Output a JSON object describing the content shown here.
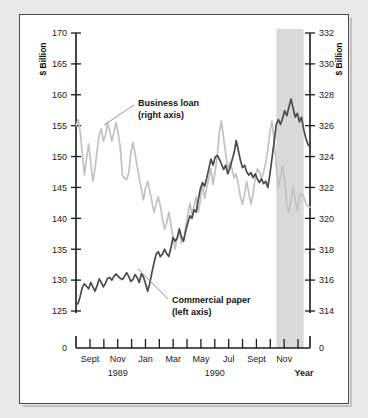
{
  "chart_data": {
    "type": "line",
    "title": "",
    "xlabel": "Year",
    "ylabel_left": "$ Billion",
    "ylabel_right": "$ Billion",
    "left_axis": {
      "label": "$ Billion",
      "ticks": [
        170,
        165,
        160,
        155,
        150,
        145,
        140,
        135,
        130,
        125
      ],
      "zero_tick": "0",
      "ylim": [
        125,
        170
      ],
      "broken_axis": true
    },
    "right_axis": {
      "label": "$ Billion",
      "ticks": [
        332,
        330,
        328,
        326,
        324,
        322,
        320,
        318,
        316,
        314
      ],
      "zero_tick": "0",
      "ylim": [
        314,
        332
      ],
      "broken_axis": true
    },
    "x_ticks": [
      "Sept",
      "",
      "Nov",
      "",
      "Jan",
      "",
      "Mar",
      "",
      "May",
      "",
      "Jul",
      "",
      "Sept",
      "",
      "Nov",
      ""
    ],
    "x_tick_labels": [
      "Sept",
      "Nov",
      "Jan",
      "Mar",
      "May",
      "Jul",
      "Sept",
      "Nov"
    ],
    "year_labels": [
      "1989",
      "1990"
    ],
    "grid": false,
    "legend_position": "inline-annotations",
    "shaded_band": {
      "label": "",
      "start_x": "Aug 1990",
      "end_x": "Oct 1990",
      "color": "#d9d9d9"
    },
    "annotations": [
      {
        "text_line1": "Business loan",
        "text_line2": "(right axis)",
        "series": "Business loan"
      },
      {
        "text_line1": "Commercial paper",
        "text_line2": "(left axis)",
        "series": "Commercial paper"
      }
    ],
    "series": [
      {
        "name": "Commercial paper",
        "axis": "left",
        "unit": "$ Billion",
        "color": "#4a4a4a",
        "values": [
          126.0,
          126.2,
          127.4,
          128.8,
          129.4,
          129.0,
          128.6,
          129.6,
          128.9,
          128.2,
          129.1,
          130.2,
          129.6,
          128.9,
          129.5,
          130.3,
          130.4,
          130.0,
          130.6,
          131.0,
          130.6,
          130.3,
          130.1,
          130.6,
          131.2,
          130.6,
          129.8,
          130.1,
          130.9,
          130.4,
          129.6,
          131.0,
          130.5,
          129.4,
          128.2,
          129.5,
          131.2,
          132.8,
          134.2,
          134.6,
          133.8,
          134.2,
          135.0,
          134.3,
          133.8,
          135.2,
          136.9,
          136.3,
          136.8,
          138.3,
          137.0,
          136.3,
          137.9,
          139.2,
          140.4,
          140.0,
          141.4,
          141.0,
          143.0,
          144.8,
          145.8,
          145.2,
          146.5,
          148.0,
          149.6,
          148.6,
          149.9,
          150.2,
          149.6,
          148.8,
          147.9,
          148.6,
          147.2,
          148.1,
          149.4,
          150.6,
          152.6,
          151.0,
          149.4,
          148.2,
          148.6,
          147.5,
          147.0,
          147.4,
          146.6,
          147.2,
          146.4,
          145.8,
          146.4,
          145.6,
          146.0,
          145.0,
          147.2,
          149.8,
          152.4,
          155.2,
          156.0,
          155.2,
          156.2,
          157.4,
          156.6,
          158.0,
          159.3,
          157.8,
          156.4,
          157.0,
          155.6,
          156.4,
          154.4,
          153.0,
          152.0,
          151.5
        ]
      },
      {
        "name": "Business loan",
        "axis": "right",
        "unit": "$ Billion",
        "color": "#c2c2c2",
        "values": [
          326.0,
          326.4,
          325.6,
          324.2,
          322.8,
          323.9,
          324.8,
          323.6,
          322.4,
          323.2,
          324.4,
          325.4,
          325.8,
          325.0,
          325.4,
          326.2,
          325.6,
          325.0,
          325.6,
          326.2,
          325.5,
          324.6,
          322.8,
          322.6,
          322.5,
          322.9,
          324.2,
          324.9,
          324.2,
          323.4,
          322.6,
          321.9,
          321.2,
          322.0,
          322.4,
          321.8,
          321.1,
          320.4,
          320.9,
          321.4,
          320.8,
          320.0,
          319.3,
          319.7,
          320.4,
          319.6,
          318.8,
          318.0,
          318.8,
          319.2,
          318.4,
          318.6,
          319.4,
          320.2,
          321.0,
          320.2,
          320.8,
          321.4,
          320.4,
          321.2,
          322.2,
          321.3,
          322.0,
          322.6,
          323.2,
          322.2,
          323.0,
          324.0,
          325.6,
          326.3,
          325.2,
          324.2,
          323.2,
          323.6,
          323.2,
          322.6,
          322.9,
          322.2,
          321.4,
          320.9,
          321.6,
          322.4,
          321.6,
          320.9,
          321.6,
          322.6,
          323.2,
          323.0,
          322.6,
          323.0,
          323.6,
          324.4,
          325.6,
          326.3,
          325.0,
          323.4,
          322.0,
          322.7,
          323.4,
          322.4,
          321.0,
          320.4,
          321.2,
          322.0,
          321.2,
          320.5,
          321.4,
          321.6,
          321.4,
          321.0,
          320.8,
          320.7
        ]
      }
    ]
  }
}
